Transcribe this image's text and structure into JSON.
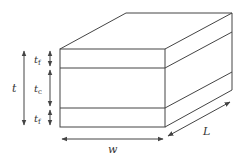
{
  "diagram": {
    "labels": {
      "total_thickness": "t",
      "face_thickness_top": {
        "base": "t",
        "sub": "f"
      },
      "core_thickness": {
        "base": "t",
        "sub": "c"
      },
      "face_thickness_bottom": {
        "base": "t",
        "sub": "f"
      },
      "width": "w",
      "length": "L"
    },
    "colors": {
      "line": "#444444",
      "background": "#ffffff"
    }
  }
}
